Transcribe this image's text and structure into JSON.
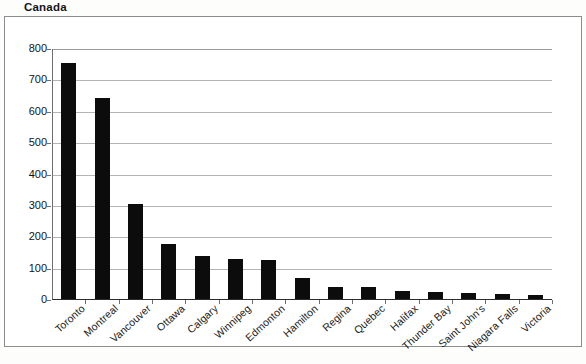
{
  "chart_data": {
    "type": "bar",
    "title": "Canada",
    "xlabel": "",
    "ylabel": "",
    "ylim": [
      0,
      800
    ],
    "ytick_step": 100,
    "yticks": [
      0,
      100,
      200,
      300,
      400,
      500,
      600,
      700,
      800
    ],
    "grid": true,
    "legend": false,
    "bar_color": "#0c0c0c",
    "categories": [
      "Toronto",
      "Montreal",
      "Vancouver",
      "Ottawa",
      "Calgary",
      "Winnipeg",
      "Edmonton",
      "Hamilton",
      "Regina",
      "Quebec",
      "Halifax",
      "Thunder Bay",
      "Saint John's",
      "Niagara Falls",
      "Victoria"
    ],
    "values": [
      755,
      645,
      305,
      180,
      140,
      132,
      128,
      70,
      40,
      40,
      28,
      27,
      23,
      18,
      17
    ]
  },
  "frame": {
    "border_color": "#8c8c8c",
    "background": "#ffffff"
  },
  "artifact": {
    "text": ""
  }
}
